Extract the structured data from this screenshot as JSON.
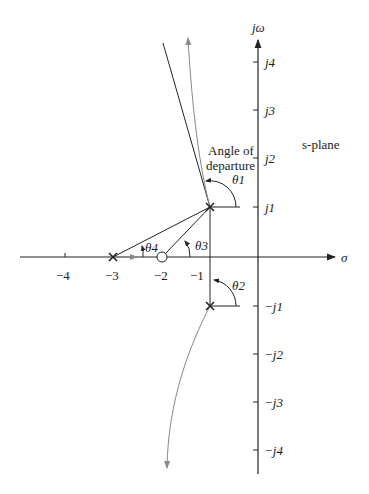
{
  "diagram": {
    "plane_label": "s-plane",
    "annotation": [
      "Angle of",
      "departure"
    ],
    "axes": {
      "real_label": "σ",
      "imag_label": "jω",
      "real_ticks": [
        "−4",
        "−3",
        "−2",
        "−1"
      ],
      "imag_ticks_pos": [
        "j4",
        "j3",
        "j2",
        "j1"
      ],
      "imag_ticks_neg": [
        "−j1",
        "−j2",
        "−j3",
        "−j4"
      ]
    },
    "poles": [
      {
        "re": -3,
        "im": 0
      },
      {
        "re": -1,
        "im": 1
      },
      {
        "re": -1,
        "im": -1
      }
    ],
    "zeros": [
      {
        "re": -2,
        "im": 0
      }
    ],
    "angles": {
      "theta1": "θ1",
      "theta2": "θ2",
      "theta3": "θ3",
      "theta4": "θ4"
    },
    "colors": {
      "line": "#222222",
      "locus": "#777777"
    }
  }
}
